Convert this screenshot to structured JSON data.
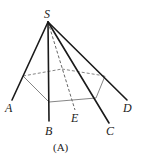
{
  "diagram": {
    "type": "pyramid",
    "apex": {
      "label": "S",
      "x": 48,
      "y": 22
    },
    "lateral_edges": [
      {
        "label": "A",
        "x": 12,
        "y": 100,
        "style": "solid"
      },
      {
        "label": "B",
        "x": 49,
        "y": 121,
        "style": "solid"
      },
      {
        "label": "C",
        "x": 109,
        "y": 123,
        "style": "solid"
      },
      {
        "label": "D",
        "x": 127,
        "y": 100,
        "style": "solid"
      },
      {
        "label": "E",
        "x": 75,
        "y": 110,
        "style": "dashed"
      }
    ],
    "section_polygon": [
      [
        23,
        76
      ],
      [
        49,
        102
      ],
      [
        96,
        98
      ],
      [
        105,
        76
      ],
      [
        62,
        69
      ]
    ],
    "labels": {
      "S": "S",
      "A": "A",
      "B": "B",
      "C": "C",
      "D": "D",
      "E": "E"
    },
    "caption": "(A)",
    "colors": {
      "edge": "#1a1a1a",
      "section": "#666666",
      "label": "#222222"
    }
  }
}
